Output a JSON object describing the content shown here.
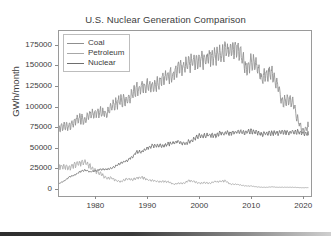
{
  "chart_data": {
    "type": "line",
    "title": "U.S. Nuclear Generation Comparison",
    "xlabel": "",
    "ylabel": "GWh/month",
    "xlim": [
      1973,
      2021.5
    ],
    "ylim": [
      -9000,
      192000
    ],
    "grid": false,
    "legend_position": "upper left",
    "xticks": [
      "1980",
      "1990",
      "2000",
      "2010",
      "2020"
    ],
    "xtick_values": [
      1980,
      1990,
      2000,
      2010,
      2020
    ],
    "yticks": [
      "0",
      "25000",
      "50000",
      "75000",
      "100000",
      "125000",
      "150000",
      "175000"
    ],
    "ytick_values": [
      0,
      25000,
      50000,
      75000,
      100000,
      125000,
      150000,
      175000
    ],
    "series": [
      {
        "name": "Coal",
        "color": "#8f8f8f",
        "x": [
          1973,
          1974,
          1975,
          1976,
          1977,
          1978,
          1979,
          1980,
          1981,
          1982,
          1983,
          1984,
          1985,
          1986,
          1987,
          1988,
          1989,
          1990,
          1991,
          1992,
          1993,
          1994,
          1995,
          1996,
          1997,
          1998,
          1999,
          2000,
          2001,
          2002,
          2003,
          2004,
          2005,
          2006,
          2007,
          2008,
          2009,
          2010,
          2011,
          2012,
          2013,
          2014,
          2015,
          2016,
          2017,
          2018,
          2019,
          2020,
          2021
        ],
        "values": [
          71000,
          73000,
          74000,
          79000,
          82000,
          81000,
          87000,
          88000,
          90000,
          87000,
          95000,
          100000,
          103000,
          103000,
          110000,
          117000,
          120000,
          121000,
          121000,
          123000,
          130000,
          132000,
          133000,
          140000,
          143000,
          147000,
          149000,
          153000,
          151000,
          155000,
          156000,
          158000,
          161000,
          162000,
          164000,
          159000,
          141000,
          150000,
          143000,
          128000,
          135000,
          136000,
          122000,
          102000,
          104000,
          102000,
          80000,
          66000,
          75000
        ],
        "peak_value": 185000,
        "peak_year": 2007,
        "note": "monthly data, strong seasonal oscillation; summer/winter peaks up to ~185000, troughs near ~120000"
      },
      {
        "name": "Petroleum",
        "color": "#a8a8a8",
        "x": [
          1973,
          1974,
          1975,
          1976,
          1977,
          1978,
          1979,
          1980,
          1981,
          1982,
          1983,
          1984,
          1985,
          1986,
          1987,
          1988,
          1989,
          1990,
          1991,
          1992,
          1993,
          1994,
          1995,
          1996,
          1997,
          1998,
          1999,
          2000,
          2001,
          2002,
          2003,
          2004,
          2005,
          2006,
          2007,
          2008,
          2009,
          2010,
          2011,
          2012,
          2013,
          2014,
          2015,
          2016,
          2017,
          2018,
          2019,
          2020,
          2021
        ],
        "values": [
          25000,
          25000,
          24000,
          27000,
          29000,
          30000,
          25000,
          20000,
          17000,
          12000,
          12000,
          9000,
          8000,
          11000,
          10000,
          12000,
          13000,
          10000,
          9000,
          8000,
          8000,
          8000,
          5000,
          6000,
          6000,
          9000,
          8000,
          6000,
          7000,
          6000,
          8000,
          8000,
          9000,
          5000,
          5000,
          4000,
          3000,
          3000,
          2000,
          1500,
          1500,
          2000,
          1500,
          1500,
          1500,
          1500,
          1200,
          1000,
          1200
        ],
        "peak_value": 37000,
        "peak_year": 1978,
        "note": "declines steadily after late-1970s oil shock; near zero after 2010"
      },
      {
        "name": "Nuclear",
        "color": "#6e6e6e",
        "x": [
          1973,
          1974,
          1975,
          1976,
          1977,
          1978,
          1979,
          1980,
          1981,
          1982,
          1983,
          1984,
          1985,
          1986,
          1987,
          1988,
          1989,
          1990,
          1991,
          1992,
          1993,
          1994,
          1995,
          1996,
          1997,
          1998,
          1999,
          2000,
          2001,
          2002,
          2003,
          2004,
          2005,
          2006,
          2007,
          2008,
          2009,
          2010,
          2011,
          2012,
          2013,
          2014,
          2015,
          2016,
          2017,
          2018,
          2019,
          2020,
          2021
        ],
        "values": [
          6000,
          9000,
          14000,
          16000,
          20000,
          22000,
          20000,
          21000,
          23000,
          23000,
          24000,
          27000,
          31000,
          33000,
          37000,
          44000,
          44000,
          48000,
          51000,
          51000,
          51000,
          53000,
          54000,
          56000,
          53000,
          56000,
          59000,
          63000,
          63000,
          64000,
          63000,
          66000,
          66000,
          66000,
          67000,
          67000,
          67000,
          68000,
          67000,
          64000,
          66000,
          66000,
          66000,
          67000,
          67000,
          67000,
          68000,
          66000,
          65000
        ],
        "peak_value": 72000,
        "peak_year": 2007,
        "note": "rises from ~5000 in 1973 to ~65000 by 2000, then flat plateau"
      }
    ]
  },
  "legend": {
    "items": [
      {
        "label": "Coal",
        "color": "#8f8f8f"
      },
      {
        "label": "Petroleum",
        "color": "#a8a8a8"
      },
      {
        "label": "Nuclear",
        "color": "#6e6e6e"
      }
    ]
  }
}
